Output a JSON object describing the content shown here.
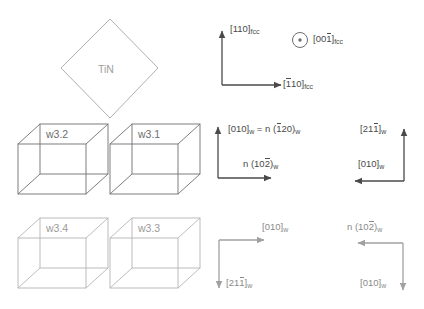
{
  "figure": {
    "type": "crystallographic-orientation-diagram",
    "background": "#ffffff"
  },
  "colors": {
    "dark_gray": "#4a4a4a",
    "mid_gray": "#6d6d6d",
    "light_gray": "#a0a0a0",
    "cube_stroke_dark": "#6f6f6f",
    "cube_stroke_light": "#b4b4b4",
    "diamond_stroke": "#b0b0b0"
  },
  "tin_crystal": {
    "label": "TiN",
    "shape": "diamond"
  },
  "cubes": [
    {
      "id": "w3.2",
      "label": "w3.2",
      "position": "top-left",
      "tone": "dark"
    },
    {
      "id": "w3.1",
      "label": "w3.1",
      "position": "top-right",
      "tone": "dark"
    },
    {
      "id": "w3.4",
      "label": "w3.4",
      "position": "bottom-left",
      "tone": "light"
    },
    {
      "id": "w3.3",
      "label": "w3.3",
      "position": "bottom-right",
      "tone": "light"
    }
  ],
  "axis_groups": [
    {
      "id": "fcc-axes",
      "tone": "dark",
      "corner": "bottom-left",
      "arrows": [
        "up",
        "right"
      ],
      "labels": {
        "vertical": {
          "bracket": "[110]",
          "bars": [],
          "sub": "fcc"
        },
        "horizontal": {
          "bracket": "[110]",
          "bars": [
            0
          ],
          "sub": "fcc"
        },
        "out_of_plane": {
          "bracket": "[001]",
          "bars": [
            2
          ],
          "sub": "fcc",
          "symbol": "circle-dot"
        }
      }
    },
    {
      "id": "w-axes-upper-left",
      "tone": "dark",
      "corner": "bottom-left",
      "arrows": [
        "up",
        "right"
      ],
      "labels": {
        "vertical": {
          "text": "[010]",
          "sub": "w",
          "equation": "= n (120)",
          "eq_bars": [
            0
          ],
          "eq_sub": "w"
        },
        "horizontal": {
          "text": "n (102)",
          "bars": [
            2
          ],
          "sub": "w"
        }
      }
    },
    {
      "id": "w-axes-upper-right",
      "tone": "dark",
      "corner": "bottom-right",
      "arrows": [
        "up",
        "left"
      ],
      "labels": {
        "vertical": {
          "text": "[211]",
          "bars": [
            2
          ],
          "sub": "w"
        },
        "horizontal": {
          "text": "[010]",
          "bars": [],
          "sub": "w"
        }
      }
    },
    {
      "id": "w-axes-lower-left",
      "tone": "light",
      "corner": "top-left",
      "arrows": [
        "right",
        "down"
      ],
      "labels": {
        "horizontal": {
          "text": "[010]",
          "bars": [],
          "sub": "w"
        },
        "vertical": {
          "text": "[211]",
          "bars": [
            2
          ],
          "sub": "w"
        }
      }
    },
    {
      "id": "w-axes-lower-right",
      "tone": "light",
      "corner": "top-right",
      "arrows": [
        "left",
        "down"
      ],
      "labels": {
        "horizontal": {
          "text": "n (102)",
          "bars": [
            2
          ],
          "sub": "w"
        },
        "vertical": {
          "text": "[010]",
          "bars": [],
          "sub": "w"
        }
      }
    }
  ],
  "text": {
    "tin": "TiN",
    "w32": "w3.2",
    "w31": "w3.1",
    "w34": "w3.4",
    "w33": "w3.3",
    "fcc_sub": "fcc",
    "w_sub": "w",
    "b110": "[110]",
    "b1bar10": "[̄1 10]",
    "b001bar": "[001]",
    "b010": "[010]",
    "b211bar": "[211]",
    "eq_n120": "= n (120)",
    "n102bar": "n (102)",
    "open_b": "[",
    "close_b": "]"
  }
}
